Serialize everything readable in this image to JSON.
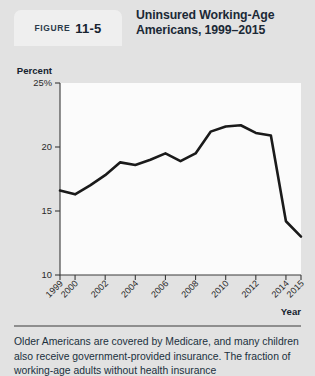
{
  "header": {
    "figure_word": "FIGURE",
    "figure_number": "11-5",
    "title": "Uninsured Working-Age Americans, 1999–2015"
  },
  "caption": {
    "text": "Older Americans are covered by Medicare, and many children also receive government-provided insurance. The fraction of working-age adults without health insurance"
  },
  "chart_data": {
    "type": "line",
    "title": "Uninsured Working-Age Americans, 1999–2015",
    "xlabel": "Year",
    "ylabel": "Percent",
    "ylim": [
      10,
      25
    ],
    "xlim": [
      1999,
      2015
    ],
    "grid": false,
    "legend": false,
    "ytick_labels": [
      "25%",
      "20",
      "15",
      "10"
    ],
    "ytick_values": [
      25,
      20,
      15,
      10
    ],
    "xtick_labels": [
      "1999",
      "2000",
      "2002",
      "2004",
      "2006",
      "2008",
      "2010",
      "2012",
      "2014",
      "2015"
    ],
    "xtick_values": [
      1999,
      2000,
      2002,
      2004,
      2006,
      2008,
      2010,
      2012,
      2014,
      2015
    ],
    "x": [
      1999,
      2000,
      2001,
      2002,
      2003,
      2004,
      2005,
      2006,
      2007,
      2008,
      2009,
      2010,
      2011,
      2012,
      2013,
      2014,
      2015
    ],
    "values": [
      16.6,
      16.3,
      17.0,
      17.8,
      18.8,
      18.6,
      19.0,
      19.5,
      18.9,
      19.5,
      21.2,
      21.6,
      21.7,
      21.1,
      20.9,
      14.2,
      13.0
    ],
    "series": [
      {
        "name": "Percent uninsured",
        "values": [
          16.6,
          16.3,
          17.0,
          17.8,
          18.8,
          18.6,
          19.0,
          19.5,
          18.9,
          19.5,
          21.2,
          21.6,
          21.7,
          21.1,
          20.9,
          14.2,
          13.0
        ]
      }
    ],
    "line_color": "#1a1a1a",
    "plot_bg": "#fbfbfb",
    "panel_bg": "#e2e2e2"
  }
}
